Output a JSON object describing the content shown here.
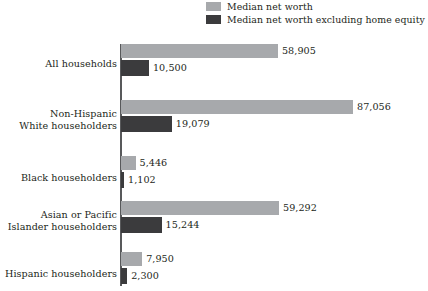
{
  "legend": {
    "position": "top-right",
    "items": [
      {
        "label": "Median net worth",
        "color": "#a7a9ac",
        "swatch_name": "legend-swatch-median-net-worth"
      },
      {
        "label": "Median net worth excluding home equity",
        "color": "#3b3b3d",
        "swatch_name": "legend-swatch-median-net-worth-excl-home-equity"
      }
    ]
  },
  "axis": {
    "orientation": "vertical-category-axis",
    "color": "#58595b"
  },
  "chart_data": {
    "type": "bar",
    "orientation": "horizontal",
    "title": "",
    "subtitle": "",
    "xlabel": "",
    "ylabel": "",
    "grid": false,
    "legend_position": "top-right",
    "xlim": [
      0,
      87056
    ],
    "value_labels": true,
    "categories": [
      "All households",
      "Non-Hispanic\nWhite householders",
      "Black householders",
      "Asian or Pacific\nIslander householders",
      "Hispanic householders"
    ],
    "series": [
      {
        "name": "Median net worth",
        "color": "#a7a9ac",
        "values": [
          58905,
          87056,
          5446,
          59292,
          7950
        ],
        "value_labels": [
          "58,905",
          "87,056",
          "5,446",
          "59,292",
          "7,950"
        ]
      },
      {
        "name": "Median net worth excluding home equity",
        "color": "#3b3b3d",
        "values": [
          10500,
          19079,
          1102,
          15244,
          2300
        ],
        "value_labels": [
          "10,500",
          "19,079",
          "1,102",
          "15,244",
          "2,300"
        ]
      }
    ]
  }
}
